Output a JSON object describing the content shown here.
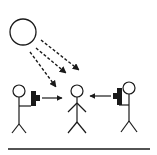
{
  "diagram": {
    "colors": {
      "stroke": "#1a1a1a",
      "background": "#ffffff"
    },
    "nodes": [
      {
        "id": "sun",
        "type": "circle",
        "cx": 23,
        "cy": 32,
        "r": 13
      },
      {
        "id": "left-person",
        "type": "stick-figure",
        "x": 19
      },
      {
        "id": "center-person",
        "type": "stick-figure",
        "x": 77
      },
      {
        "id": "right-person",
        "type": "stick-figure",
        "x": 128
      },
      {
        "id": "left-flash",
        "type": "flash-device"
      },
      {
        "id": "right-flash",
        "type": "flash-device"
      }
    ],
    "edges": [
      {
        "from": "sun",
        "to": "center-person",
        "style": "dashed",
        "count": 3
      },
      {
        "from": "left-flash",
        "to": "center-person",
        "style": "solid"
      },
      {
        "from": "right-flash",
        "to": "center-person",
        "style": "solid"
      }
    ],
    "ground_line": true
  }
}
